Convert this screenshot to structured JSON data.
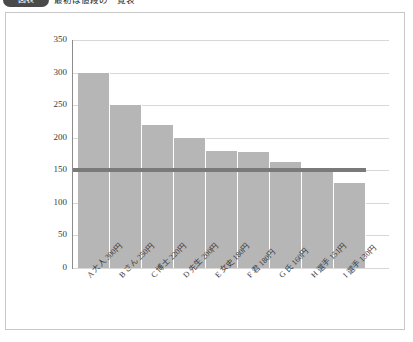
{
  "header": {
    "badge_label": "図表",
    "caption": "最初は値段の一覧表"
  },
  "chart_data": {
    "type": "bar",
    "title": "",
    "xlabel": "",
    "ylabel": "",
    "ylim": [
      0,
      350
    ],
    "ytick_step": 50,
    "yticks": [
      350,
      300,
      250,
      200,
      150,
      100,
      50,
      0
    ],
    "ytick_labels": [
      "350",
      "300",
      "250",
      "200",
      "150",
      "100",
      "50",
      "0"
    ],
    "grid": true,
    "legend": "none",
    "bar_color": "#b6b6b6",
    "threshold_color": "#7a7a7a",
    "categories": [
      "A 大人 300円",
      "B さん 250円",
      "C 博士 220円",
      "D 先生 200円",
      "E 女史 180円",
      "F 君 180円",
      "G 氏 160円",
      "H 選手 151円",
      "I 選手 130円"
    ],
    "category_keys": [
      "A",
      "B",
      "C",
      "D",
      "E",
      "F",
      "G",
      "H",
      "I"
    ],
    "values": [
      300,
      250,
      220,
      200,
      180,
      178,
      162,
      153,
      130
    ],
    "annotations": [
      {
        "type": "hline",
        "value": 150,
        "label": ""
      }
    ]
  }
}
